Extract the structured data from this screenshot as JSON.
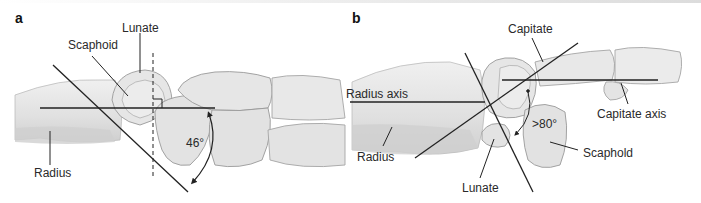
{
  "figure": {
    "panels": [
      {
        "id": "a",
        "label": "a",
        "annotations": {
          "lunate": "Lunate",
          "scaphoid": "Scaphoid",
          "radius": "Radius",
          "angle": "46°"
        }
      },
      {
        "id": "b",
        "label": "b",
        "annotations": {
          "capitate": "Capitate",
          "radius_axis": "Radius axis",
          "capitate_axis": "Capitate axis",
          "radius": "Radius",
          "lunate": "Lunate",
          "scaphoid": "Scaphold",
          "angle": ">80°"
        }
      }
    ],
    "colors": {
      "bone_fill": "#e4e4e4",
      "bone_shadow": "#c9c9c9",
      "bone_outline": "#9a9a9a",
      "line": "#222222",
      "text": "#2a2a2a"
    }
  }
}
